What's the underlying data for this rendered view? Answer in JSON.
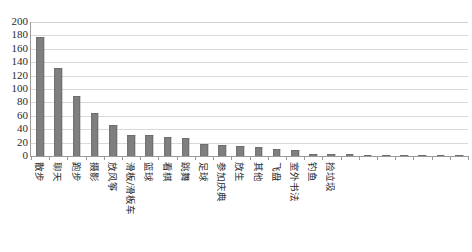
{
  "chart_data": {
    "type": "bar",
    "title": "",
    "subtitle": "",
    "xlabel": "",
    "ylabel": "",
    "ylim": [
      0,
      200
    ],
    "ytick_step": 20,
    "yticks": [
      200,
      180,
      160,
      140,
      120,
      100,
      80,
      60,
      40,
      20,
      0
    ],
    "grid": true,
    "legend": "none",
    "bar_color": "#7f7f7f",
    "gridline_color": "#d9d9d9",
    "axis_color": "#9a9a9a",
    "categories": [
      "散步",
      "聊天",
      "跑步",
      "摄影",
      "放风筝",
      "滑板/滑板车",
      "篮球",
      "看棋",
      "跳舞",
      "足球",
      "参加庆典",
      "放生",
      "其他",
      "飞盘",
      "室外书法",
      "钓鱼",
      "捡垃圾",
      "",
      "",
      "",
      "",
      "",
      "",
      ""
    ],
    "values": [
      178,
      132,
      90,
      64,
      46,
      32,
      32,
      28,
      27,
      18,
      17,
      15,
      13,
      10,
      9,
      3,
      2.5,
      2.5,
      1.5,
      1,
      1,
      0.8,
      0.5,
      0.5
    ],
    "visible_tick_labels": [
      "散步",
      "聊天",
      "跑步",
      "摄影",
      "放风筝",
      "滑板/滑板车",
      "篮球",
      "看棋",
      "跳舞",
      "足球",
      "参加庆典",
      "放生",
      "其他",
      "飞盘",
      "室外书法",
      "钓鱼",
      "捡垃圾"
    ]
  }
}
